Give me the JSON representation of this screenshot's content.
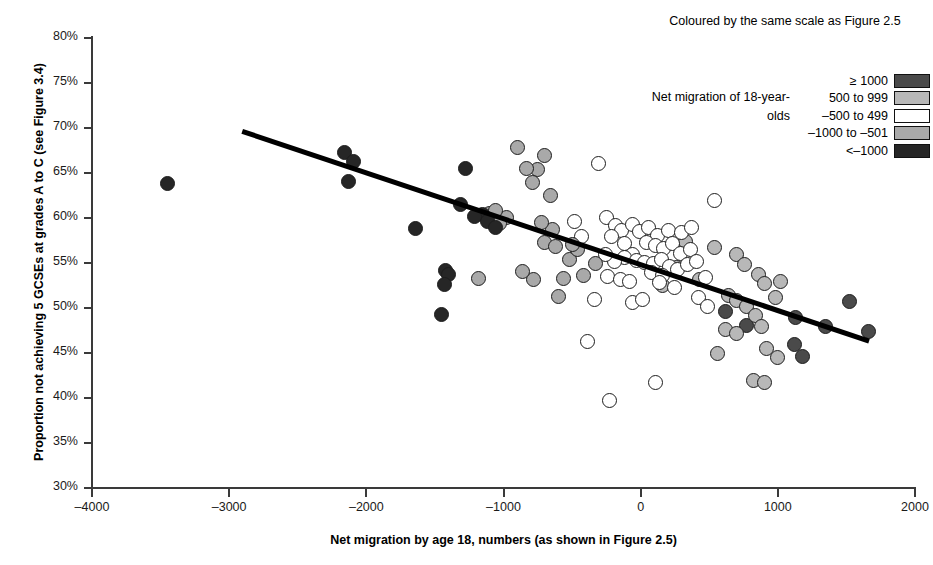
{
  "chart_data": {
    "type": "scatter",
    "title": "",
    "xlabel": "Net migration by age 18, numbers (as shown in Figure 2.5)",
    "ylabel": "Proportion not achieving 5 GCSEs at grades A to C (see Figure 3.4)",
    "xlim": [
      -4000,
      2000
    ],
    "ylim": [
      30,
      80
    ],
    "xticks": [
      -4000,
      -3000,
      -2000,
      -1000,
      0,
      1000,
      2000
    ],
    "xticklabels": [
      "–4000",
      "–3000",
      "–2000",
      "–1000",
      "0",
      "1000",
      "2000"
    ],
    "yticks": [
      30,
      35,
      40,
      45,
      50,
      55,
      60,
      65,
      70,
      75,
      80
    ],
    "yticklabels": [
      "30%",
      "35%",
      "40%",
      "45%",
      "50%",
      "55%",
      "60%",
      "65%",
      "70%",
      "75%",
      "80%"
    ],
    "grid": false,
    "legend_position": "top-right",
    "trendline": {
      "x0": -2900,
      "y0": 69.9,
      "x1": 1670,
      "y1": 46.6,
      "color": "#000000",
      "width": 5
    },
    "legend": {
      "title": "Coloured by the same scale as Figure 2.5",
      "side_label": "Net migration of 18-year-olds",
      "entries": [
        {
          "label": "≥ 1000",
          "color": "#4a4a4a"
        },
        {
          "label": "500 to 999",
          "color": "#b8b8b8"
        },
        {
          "label": "–500 to 499",
          "color": "#ffffff"
        },
        {
          "label": "–1000 to –501",
          "color": "#a9a9a9"
        },
        {
          "label": "<–1000",
          "color": "#262626"
        }
      ]
    },
    "series": [
      {
        "name": "≥ 1000",
        "color": "#4a4a4a",
        "points": [
          [
            1130,
            48.9
          ],
          [
            1350,
            47.9
          ],
          [
            1660,
            47.4
          ],
          [
            1520,
            50.7
          ],
          [
            1120,
            46.0
          ],
          [
            1180,
            44.6
          ],
          [
            770,
            48.1
          ],
          [
            620,
            49.6
          ]
        ]
      },
      {
        "name": "500 to 999",
        "color": "#b8b8b8",
        "points": [
          [
            700,
            55.9
          ],
          [
            540,
            56.7
          ],
          [
            760,
            54.8
          ],
          [
            860,
            53.7
          ],
          [
            900,
            52.7
          ],
          [
            640,
            51.4
          ],
          [
            700,
            50.8
          ],
          [
            770,
            50.2
          ],
          [
            840,
            49.2
          ],
          [
            880,
            48.0
          ],
          [
            620,
            47.6
          ],
          [
            700,
            47.2
          ],
          [
            920,
            45.5
          ],
          [
            1000,
            44.5
          ],
          [
            820,
            42.0
          ],
          [
            900,
            41.7
          ],
          [
            330,
            57.4
          ],
          [
            260,
            54.5
          ],
          [
            430,
            53.2
          ],
          [
            160,
            52.5
          ],
          [
            980,
            51.2
          ],
          [
            1020,
            52.9
          ],
          [
            560,
            44.9
          ]
        ]
      },
      {
        "name": "–500 to 499",
        "color": "#ffffff",
        "points": [
          [
            -310,
            66.1
          ],
          [
            540,
            62.0
          ],
          [
            -250,
            60.1
          ],
          [
            -180,
            59.2
          ],
          [
            -140,
            58.6
          ],
          [
            -210,
            57.9
          ],
          [
            -120,
            57.2
          ],
          [
            -60,
            59.3
          ],
          [
            -10,
            58.5
          ],
          [
            60,
            58.9
          ],
          [
            120,
            58.1
          ],
          [
            200,
            58.6
          ],
          [
            300,
            58.4
          ],
          [
            370,
            59.0
          ],
          [
            40,
            57.3
          ],
          [
            110,
            56.9
          ],
          [
            170,
            56.6
          ],
          [
            230,
            57.2
          ],
          [
            290,
            56.1
          ],
          [
            360,
            56.5
          ],
          [
            -60,
            56.0
          ],
          [
            -120,
            55.6
          ],
          [
            -190,
            55.2
          ],
          [
            -260,
            55.9
          ],
          [
            -30,
            55.3
          ],
          [
            30,
            55.1
          ],
          [
            90,
            54.9
          ],
          [
            150,
            55.4
          ],
          [
            210,
            54.6
          ],
          [
            270,
            54.3
          ],
          [
            340,
            54.8
          ],
          [
            410,
            55.2
          ],
          [
            80,
            53.9
          ],
          [
            160,
            53.6
          ],
          [
            -240,
            53.5
          ],
          [
            -150,
            53.2
          ],
          [
            -80,
            52.9
          ],
          [
            140,
            52.8
          ],
          [
            -340,
            51.0
          ],
          [
            420,
            51.2
          ],
          [
            490,
            50.2
          ],
          [
            -390,
            46.3
          ],
          [
            -230,
            39.7
          ],
          [
            110,
            41.7
          ],
          [
            -60,
            50.6
          ],
          [
            10,
            50.9
          ],
          [
            470,
            53.4
          ],
          [
            -430,
            58.0
          ],
          [
            -480,
            59.6
          ],
          [
            250,
            52.3
          ]
        ]
      },
      {
        "name": "–1000 to –501",
        "color": "#a9a9a9",
        "points": [
          [
            -900,
            67.8
          ],
          [
            -700,
            67.0
          ],
          [
            -750,
            65.4
          ],
          [
            -660,
            62.5
          ],
          [
            -830,
            65.5
          ],
          [
            -790,
            63.9
          ],
          [
            -640,
            58.7
          ],
          [
            -720,
            59.5
          ],
          [
            -980,
            60.1
          ],
          [
            -1030,
            59.4
          ],
          [
            -700,
            57.3
          ],
          [
            -620,
            56.8
          ],
          [
            -560,
            53.3
          ],
          [
            -780,
            53.2
          ],
          [
            -860,
            54.1
          ],
          [
            -600,
            51.3
          ],
          [
            -1180,
            53.3
          ],
          [
            -520,
            55.4
          ],
          [
            -460,
            56.5
          ],
          [
            -420,
            53.6
          ],
          [
            -500,
            57.1
          ],
          [
            -330,
            55.0
          ],
          [
            -1100,
            60.5
          ],
          [
            -1060,
            60.8
          ]
        ]
      },
      {
        "name": "<–1000",
        "color": "#262626",
        "points": [
          [
            -3450,
            63.8
          ],
          [
            -2160,
            67.3
          ],
          [
            -2090,
            66.3
          ],
          [
            -2130,
            64.1
          ],
          [
            -1640,
            58.8
          ],
          [
            -1280,
            65.5
          ],
          [
            -1310,
            61.5
          ],
          [
            -1150,
            60.4
          ],
          [
            -1120,
            59.6
          ],
          [
            -1210,
            60.2
          ],
          [
            -1420,
            54.2
          ],
          [
            -1400,
            53.7
          ],
          [
            -1430,
            52.6
          ],
          [
            -1450,
            49.3
          ],
          [
            -1060,
            59.0
          ]
        ]
      }
    ]
  }
}
